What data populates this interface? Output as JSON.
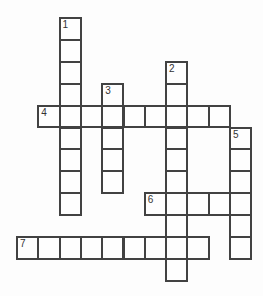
{
  "puzzle": {
    "type": "crossword",
    "grid": {
      "columns": 11,
      "rows": 12,
      "cell_width": 21.3,
      "cell_height": 21.9,
      "origin_x": 16,
      "origin_y": 17,
      "line_width": 2
    },
    "colors": {
      "page_bg": "#fdfdfd",
      "cell_fill": "#fefefe",
      "grid_line": "#424242",
      "number_text": "#333333"
    },
    "entries": [
      {
        "number": "1",
        "direction": "down",
        "row": 0,
        "col": 2,
        "length": 9
      },
      {
        "number": "2",
        "direction": "down",
        "row": 2,
        "col": 7,
        "length": 10
      },
      {
        "number": "3",
        "direction": "down",
        "row": 3,
        "col": 4,
        "length": 5
      },
      {
        "number": "4",
        "direction": "across",
        "row": 4,
        "col": 1,
        "length": 9
      },
      {
        "number": "5",
        "direction": "down",
        "row": 5,
        "col": 10,
        "length": 6
      },
      {
        "number": "6",
        "direction": "across",
        "row": 8,
        "col": 6,
        "length": 5
      },
      {
        "number": "7",
        "direction": "across",
        "row": 10,
        "col": 0,
        "length": 9
      }
    ]
  }
}
